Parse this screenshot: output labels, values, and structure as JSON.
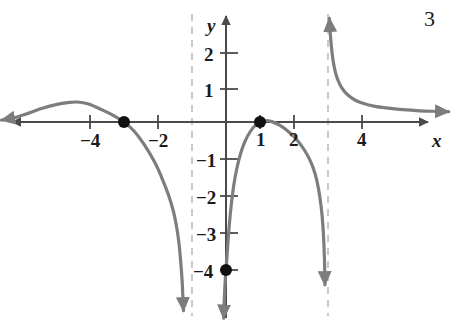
{
  "figure": {
    "number_label": "3",
    "background_color": "#ffffff",
    "curve_color": "#7d7d7d",
    "axis_color": "#4a4a4a",
    "asymptote_color": "#b5b5b5",
    "point_color": "#111111",
    "text_color": "#1a1a1a"
  },
  "axes": {
    "x_axis_label": "x",
    "y_axis_label": "y",
    "x_ticks": [
      {
        "value": -4,
        "label": "−4"
      },
      {
        "value": -2,
        "label": "−2"
      },
      {
        "value": 1,
        "label": "1"
      },
      {
        "value": 2,
        "label": "2"
      },
      {
        "value": 4,
        "label": "4"
      }
    ],
    "y_ticks": [
      {
        "value": 2,
        "label": "2"
      },
      {
        "value": 1,
        "label": "1"
      },
      {
        "value": -1,
        "label": "−1"
      },
      {
        "value": -2,
        "label": "−2"
      },
      {
        "value": -3,
        "label": "−3"
      },
      {
        "value": -4,
        "label": "−4"
      }
    ]
  },
  "chart_data": {
    "type": "line",
    "title": "",
    "xlabel": "x",
    "ylabel": "y",
    "grid": false,
    "legend": "none",
    "xlim": [
      -6.6,
      6.7
    ],
    "ylim": [
      -5.3,
      2.8
    ],
    "x_tick_values": [
      -4,
      -2,
      1,
      2,
      4
    ],
    "y_tick_values": [
      2,
      1,
      -1,
      -2,
      -3,
      -4
    ],
    "asymptotes": [
      {
        "kind": "vertical",
        "x": -1,
        "style": "dashed"
      },
      {
        "kind": "vertical",
        "x": 3,
        "style": "dashed"
      }
    ],
    "marked_points": [
      {
        "x": -3,
        "y": 0,
        "label": "x-intercept",
        "style": "filled-circle"
      },
      {
        "x": 1,
        "y": 0,
        "label": "x-intercept",
        "style": "filled-circle"
      },
      {
        "x": 0,
        "y": -4,
        "label": "y-intercept",
        "style": "filled-circle"
      }
    ],
    "series": [
      {
        "name": "branch-left",
        "domain": [
          -6.6,
          -1
        ],
        "points": [
          [
            -6.6,
            0.05
          ],
          [
            -6.2,
            0.12
          ],
          [
            -5.8,
            0.24
          ],
          [
            -5.4,
            0.37
          ],
          [
            -5.0,
            0.47
          ],
          [
            -4.6,
            0.53
          ],
          [
            -4.4,
            0.54
          ],
          [
            -4.2,
            0.52
          ],
          [
            -4.0,
            0.47
          ],
          [
            -3.7,
            0.35
          ],
          [
            -3.4,
            0.22
          ],
          [
            -3.0,
            0.0
          ],
          [
            -2.7,
            -0.25
          ],
          [
            -2.4,
            -0.62
          ],
          [
            -2.1,
            -1.08
          ],
          [
            -1.9,
            -1.48
          ],
          [
            -1.7,
            -1.95
          ],
          [
            -1.55,
            -2.4
          ],
          [
            -1.45,
            -2.85
          ],
          [
            -1.38,
            -3.3
          ],
          [
            -1.33,
            -3.8
          ],
          [
            -1.29,
            -4.3
          ],
          [
            -1.27,
            -4.7
          ],
          [
            -1.25,
            -5.1
          ]
        ],
        "end_arrows": [
          "start",
          "end"
        ]
      },
      {
        "name": "branch-middle",
        "domain": [
          -1,
          3
        ],
        "points": [
          [
            -0.07,
            -5.3
          ],
          [
            -0.05,
            -4.8
          ],
          [
            -0.03,
            -4.4
          ],
          [
            0.0,
            -4.0
          ],
          [
            0.05,
            -3.35
          ],
          [
            0.1,
            -2.75
          ],
          [
            0.16,
            -2.2
          ],
          [
            0.23,
            -1.7
          ],
          [
            0.32,
            -1.25
          ],
          [
            0.43,
            -0.85
          ],
          [
            0.56,
            -0.52
          ],
          [
            0.72,
            -0.25
          ],
          [
            0.88,
            -0.07
          ],
          [
            1.0,
            0.0
          ],
          [
            1.15,
            0.04
          ],
          [
            1.35,
            0.01
          ],
          [
            1.6,
            -0.1
          ],
          [
            1.85,
            -0.27
          ],
          [
            2.1,
            -0.5
          ],
          [
            2.3,
            -0.75
          ],
          [
            2.48,
            -1.05
          ],
          [
            2.62,
            -1.4
          ],
          [
            2.72,
            -1.8
          ],
          [
            2.8,
            -2.3
          ],
          [
            2.85,
            -2.8
          ],
          [
            2.88,
            -3.3
          ],
          [
            2.9,
            -3.85
          ],
          [
            2.91,
            -4.4
          ]
        ],
        "end_arrows": [
          "start",
          "end"
        ]
      },
      {
        "name": "branch-right",
        "domain": [
          3,
          6.7
        ],
        "points": [
          [
            3.04,
            2.8
          ],
          [
            3.07,
            2.35
          ],
          [
            3.11,
            1.95
          ],
          [
            3.16,
            1.6
          ],
          [
            3.23,
            1.3
          ],
          [
            3.33,
            1.05
          ],
          [
            3.46,
            0.85
          ],
          [
            3.62,
            0.7
          ],
          [
            3.82,
            0.58
          ],
          [
            4.05,
            0.5
          ],
          [
            4.35,
            0.43
          ],
          [
            4.7,
            0.38
          ],
          [
            5.1,
            0.34
          ],
          [
            5.6,
            0.31
          ],
          [
            6.1,
            0.29
          ],
          [
            6.55,
            0.28
          ]
        ],
        "end_arrows": [
          "start",
          "end"
        ]
      }
    ]
  }
}
